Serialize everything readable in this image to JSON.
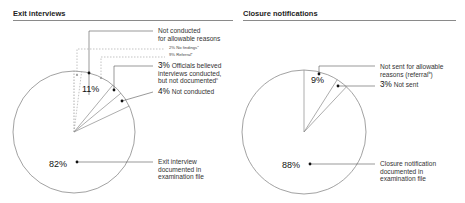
{
  "chart_data": [
    {
      "type": "pie",
      "title": "Exit interviews",
      "slices": [
        {
          "label": "Not conducted for allowable reasons",
          "value": 11,
          "sub": [
            {
              "label": "No findings",
              "value": 2,
              "footnote": "a"
            },
            {
              "label": "Referral",
              "value": 9,
              "footnote": "b"
            }
          ]
        },
        {
          "label": "Officials believed interviews conducted, but not documented",
          "value": 3,
          "footnote": "c"
        },
        {
          "label": "Not conducted",
          "value": 4
        },
        {
          "label": "Exit interview documented in examination file",
          "value": 82
        }
      ]
    },
    {
      "type": "pie",
      "title": "Closure notifications",
      "slices": [
        {
          "label": "Not sent for allowable reasons (referral)",
          "value": 9,
          "footnote": "b"
        },
        {
          "label": "Not sent",
          "value": 3
        },
        {
          "label": "Closure notification documented in examination file",
          "value": 88
        }
      ]
    }
  ],
  "left": {
    "title": "Exit interviews",
    "allowable_line1": "Not conducted",
    "allowable_line2": "for allowable reasons",
    "no_findings": "2% No findings",
    "no_findings_fn": "a",
    "referral": "9% Referral",
    "referral_fn": "b",
    "pct_11": "11%",
    "officials_pct": "3%",
    "officials_line1": " Officials believed",
    "officials_line2": "interviews conducted,",
    "officials_line3": "but not documented",
    "officials_fn": "c",
    "notcond_pct": "4%",
    "notcond_label": " Not conducted",
    "pct_82": "82%",
    "documented_line1": "Exit interview",
    "documented_line2": "documented in",
    "documented_line3": "examination file"
  },
  "right": {
    "title": "Closure notifications",
    "notsent_allow_line1": "Not sent for allowable",
    "notsent_allow_line2": "reasons (referral",
    "notsent_allow_fn": "b",
    "notsent_allow_close": ")",
    "pct_9": "9%",
    "notsent_pct": "3%",
    "notsent_label": " Not sent",
    "pct_88": "88%",
    "documented_line1": "Closure notification",
    "documented_line2": "documented in",
    "documented_line3": "examination file"
  },
  "colors": {
    "line": "#555555",
    "pie_edge": "#8a8a8a",
    "dotted": "#9a9a9a"
  }
}
